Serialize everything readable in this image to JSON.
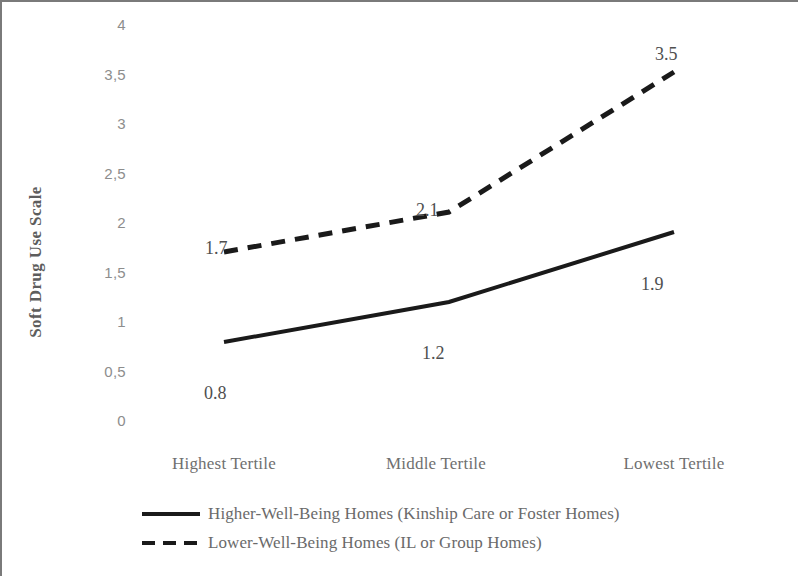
{
  "chart_data": {
    "type": "line",
    "title": "",
    "xlabel": "",
    "ylabel": "Soft Drug Use Scale",
    "categories": [
      "Highest Tertile",
      "Middle Tertile",
      "Lowest Tertile"
    ],
    "series": [
      {
        "name": "Higher-Well-Being Homes (Kinship Care or Foster Homes)",
        "style": "solid",
        "color": "#1a1a1a",
        "values": [
          0.8,
          1.2,
          1.9
        ],
        "point_labels": [
          "0.8",
          "1.2",
          "1.9"
        ]
      },
      {
        "name": "Lower-Well-Being Homes (IL or Group Homes)",
        "style": "dashed",
        "color": "#1a1a1a",
        "values": [
          1.7,
          2.1,
          3.5
        ],
        "point_labels": [
          "1.7",
          "2.1",
          "3.5"
        ]
      }
    ],
    "ylim": [
      0,
      4
    ],
    "ytick_values": [
      4,
      3.5,
      3,
      2.5,
      2,
      1.5,
      1,
      0.5,
      0
    ],
    "ytick_labels": [
      "4",
      "3,5",
      "3",
      "2,5",
      "2",
      "1,5",
      "1",
      "0,5",
      "0"
    ],
    "grid": false,
    "axis_lines": false,
    "legend_position": "bottom"
  },
  "axis": {
    "y_title": "Soft Drug Use Scale"
  },
  "legend": {
    "items": [
      {
        "label": "Higher-Well-Being Homes (Kinship Care or Foster Homes)",
        "style": "solid"
      },
      {
        "label": "Lower-Well-Being Homes (IL or Group Homes)",
        "style": "dashed"
      }
    ]
  },
  "ticks": {
    "y": [
      "4",
      "3,5",
      "3",
      "2,5",
      "2",
      "1,5",
      "1",
      "0,5",
      "0"
    ],
    "x": [
      "Highest Tertile",
      "Middle Tertile",
      "Lowest Tertile"
    ]
  },
  "labels": {
    "solid": [
      "0.8",
      "1.2",
      "1.9"
    ],
    "dashed": [
      "1.7",
      "2.1",
      "3.5"
    ]
  }
}
